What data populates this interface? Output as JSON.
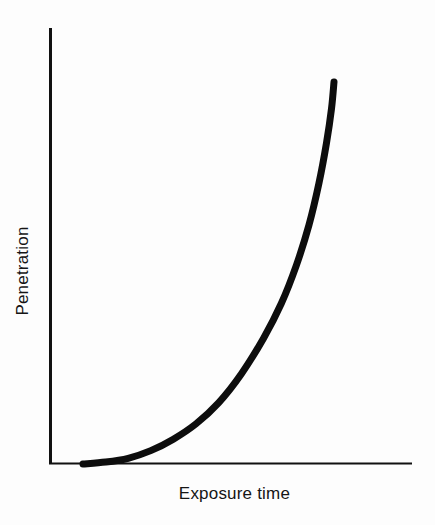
{
  "chart_data": {
    "type": "line",
    "title": "",
    "subtitle": "",
    "xlabel": "Exposure time",
    "ylabel": "Penetration",
    "x_tick_labels": [],
    "y_tick_labels": [],
    "grid": false,
    "legend": null,
    "legend_position": "none",
    "xlim": [
      0,
      1
    ],
    "ylim": [
      0,
      1
    ],
    "annotations": [],
    "series": [
      {
        "name": "Penetration vs exposure time",
        "description": "Monotonic accelerating (exponential-like) rise; nearly flat along the baseline at small exposure times, then curving sharply upward and ending steeply near-vertical.",
        "x": [
          0.0,
          0.09,
          0.18,
          0.27,
          0.36,
          0.45,
          0.54,
          0.63,
          0.72,
          0.79,
          0.85,
          0.9,
          0.94,
          0.97,
          0.99,
          1.0
        ],
        "y": [
          0.0,
          0.005,
          0.015,
          0.035,
          0.065,
          0.105,
          0.16,
          0.235,
          0.33,
          0.42,
          0.52,
          0.625,
          0.735,
          0.84,
          0.93,
          1.0
        ]
      }
    ]
  },
  "style": {
    "background": "#fdfdfd",
    "ink": "#101010",
    "curve_color": "#0d0d0d",
    "axis_color": "#111111",
    "curve_width_px": 7,
    "yaxis_width_px": 3,
    "xaxis_width_px": 2
  },
  "geometry": {
    "origin_x": 50,
    "origin_y": 464,
    "yaxis_top": 28,
    "xaxis_right": 412,
    "curve_start_x": 83,
    "curve_end_x": 334,
    "curve_end_y": 82
  }
}
